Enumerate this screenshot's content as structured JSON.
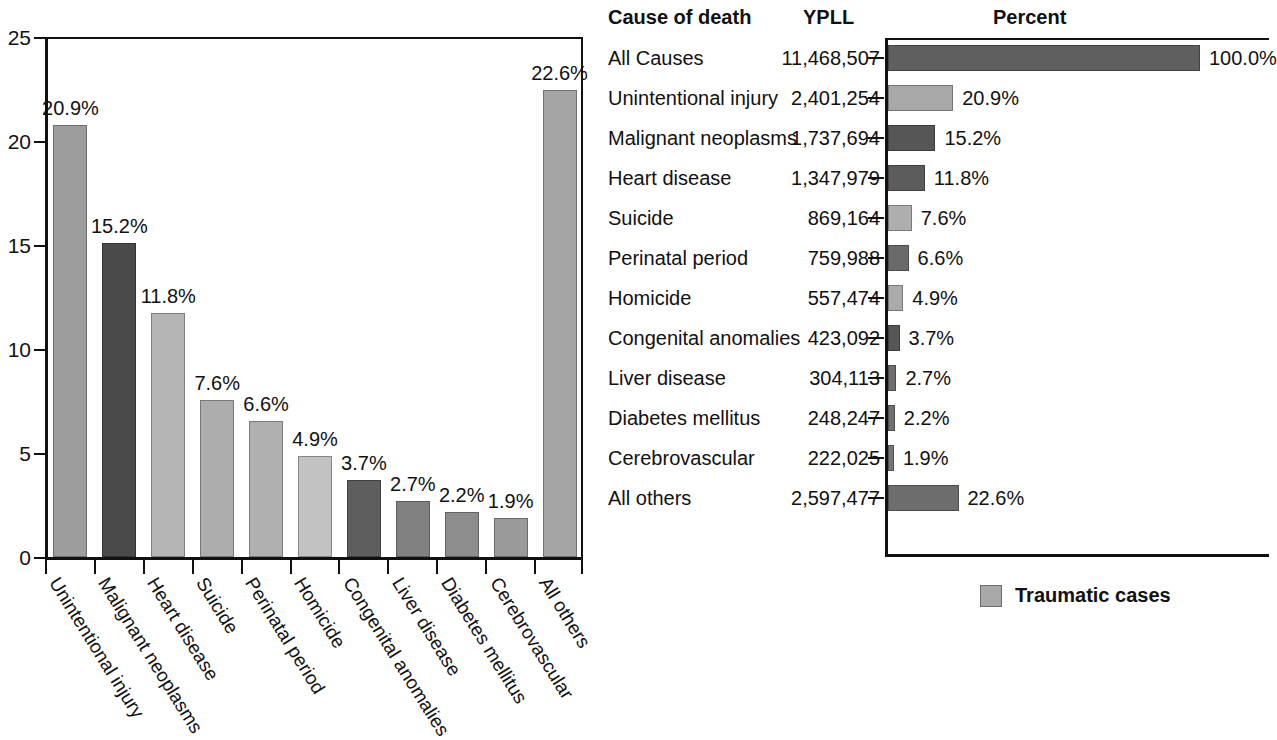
{
  "chart_data": [
    {
      "type": "bar",
      "title": "",
      "xlabel": "",
      "ylabel": "",
      "ylim": [
        0,
        25
      ],
      "yticks": [
        "0",
        "5",
        "10",
        "15",
        "20",
        "25"
      ],
      "grid": false,
      "orientation": "vertical",
      "categories": [
        "Unintentional injury",
        "Malignant neoplasms",
        "Heart disease",
        "Suicide",
        "Perinatal period",
        "Homicide",
        "Congenital anomalies",
        "Liver disease",
        "Diabetes mellitus",
        "Cerebrovascular",
        "All others"
      ],
      "values": [
        20.9,
        15.2,
        11.8,
        7.6,
        6.6,
        4.9,
        3.7,
        2.7,
        2.2,
        1.9,
        22.6
      ],
      "data_labels": [
        "20.9%",
        "15.2%",
        "11.8%",
        "7.6%",
        "6.6%",
        "4.9%",
        "3.7%",
        "2.7%",
        "2.2%",
        "1.9%",
        "22.6%"
      ],
      "bar_fills": [
        "#9d9d9d",
        "#4a4a4a",
        "#b5b5b5",
        "#adadad",
        "#b0b0b0",
        "#c2c2c2",
        "#5e5e5e",
        "#818181",
        "#8d8d8d",
        "#9a9a9a",
        "#a5a5a5"
      ]
    },
    {
      "type": "bar",
      "orientation": "horizontal",
      "title": "Percent",
      "xlabel": "",
      "ylabel": "",
      "xlim": [
        0,
        100
      ],
      "grid": false,
      "categories": [
        "All Causes",
        "Unintentional injury",
        "Malignant neoplasms",
        "Heart disease",
        "Suicide",
        "Perinatal period",
        "Homicide",
        "Congenital anomalies",
        "Liver disease",
        "Diabetes mellitus",
        "Cerebrovascular",
        "All others"
      ],
      "values": [
        100.0,
        20.9,
        15.2,
        11.8,
        7.6,
        6.6,
        4.9,
        3.7,
        2.7,
        2.2,
        1.9,
        22.6
      ],
      "data_labels": [
        "100.0%",
        "20.9%",
        "15.2%",
        "11.8%",
        "7.6%",
        "6.6%",
        "4.9%",
        "3.7%",
        "2.7%",
        "2.2%",
        "1.9%",
        "22.6%"
      ],
      "ypll": [
        "11,468,507",
        "2,401,254",
        "1,737,694",
        "1,347,979",
        "869,164",
        "759,988",
        "557,474",
        "423,092",
        "304,113",
        "248,247",
        "222,025",
        "2,597,477"
      ],
      "bar_fills": [
        "#5f5f5f",
        "#a8a8a8",
        "#565656",
        "#5c5c5c",
        "#aeaeae",
        "#6a6a6a",
        "#ababab",
        "#565656",
        "#6e6e6e",
        "#707070",
        "#767676",
        "#6d6d6d"
      ]
    }
  ],
  "left_chart": {
    "y_ticks": [
      {
        "label": "0",
        "value": 0
      },
      {
        "label": "5",
        "value": 5
      },
      {
        "label": "10",
        "value": 10
      },
      {
        "label": "15",
        "value": 15
      },
      {
        "label": "20",
        "value": 20
      },
      {
        "label": "25",
        "value": 25
      }
    ]
  },
  "table": {
    "headers": {
      "cause": "Cause of death",
      "ypll": "YPLL",
      "percent": "Percent"
    },
    "rows": [
      {
        "cause": "All Causes",
        "ypll": "11,468,507",
        "percent": "100.0%",
        "value": 100.0,
        "fill": "#5f5f5f"
      },
      {
        "cause": "Unintentional injury",
        "ypll": "2,401,254",
        "percent": "20.9%",
        "value": 20.9,
        "fill": "#a8a8a8"
      },
      {
        "cause": "Malignant neoplasms",
        "ypll": "1,737,694",
        "percent": "15.2%",
        "value": 15.2,
        "fill": "#565656"
      },
      {
        "cause": "Heart disease",
        "ypll": "1,347,979",
        "percent": "11.8%",
        "value": 11.8,
        "fill": "#5c5c5c"
      },
      {
        "cause": "Suicide",
        "ypll": "869,164",
        "percent": "7.6%",
        "value": 7.6,
        "fill": "#aeaeae"
      },
      {
        "cause": "Perinatal period",
        "ypll": "759,988",
        "percent": "6.6%",
        "value": 6.6,
        "fill": "#6a6a6a"
      },
      {
        "cause": "Homicide",
        "ypll": "557,474",
        "percent": "4.9%",
        "value": 4.9,
        "fill": "#ababab"
      },
      {
        "cause": "Congenital anomalies",
        "ypll": "423,092",
        "percent": "3.7%",
        "value": 3.7,
        "fill": "#565656"
      },
      {
        "cause": "Liver disease",
        "ypll": "304,113",
        "percent": "2.7%",
        "value": 2.7,
        "fill": "#6e6e6e"
      },
      {
        "cause": "Diabetes mellitus",
        "ypll": "248,247",
        "percent": "2.2%",
        "value": 2.2,
        "fill": "#707070"
      },
      {
        "cause": "Cerebrovascular",
        "ypll": "222,025",
        "percent": "1.9%",
        "value": 1.9,
        "fill": "#767676"
      },
      {
        "cause": "All others",
        "ypll": "2,597,477",
        "percent": "22.6%",
        "value": 22.6,
        "fill": "#6d6d6d"
      }
    ]
  },
  "legend": {
    "label": "Traumatic cases",
    "swatch_color": "#a8a8a8"
  }
}
